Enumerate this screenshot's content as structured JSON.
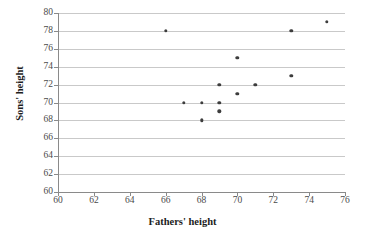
{
  "chart_data": {
    "type": "scatter",
    "title": "",
    "xlabel": "Fathers' height",
    "ylabel": "Sons' height",
    "xlim": [
      60,
      76
    ],
    "ylim": [
      60,
      80
    ],
    "xticks": [
      60,
      62,
      64,
      66,
      68,
      70,
      72,
      74,
      76
    ],
    "yticks": [
      60,
      62,
      64,
      66,
      68,
      70,
      72,
      74,
      76,
      78,
      80
    ],
    "grid": "horizontal",
    "legend": "none",
    "marker_color": "#3d3d3d",
    "gridline_color": "#c9c9c9",
    "axis_color": "#8a8a8a",
    "points": [
      {
        "x": 66,
        "y": 78
      },
      {
        "x": 67,
        "y": 70
      },
      {
        "x": 68,
        "y": 70
      },
      {
        "x": 68,
        "y": 68
      },
      {
        "x": 69,
        "y": 72
      },
      {
        "x": 69,
        "y": 70
      },
      {
        "x": 69,
        "y": 69
      },
      {
        "x": 70,
        "y": 75
      },
      {
        "x": 70,
        "y": 71
      },
      {
        "x": 71,
        "y": 72
      },
      {
        "x": 73,
        "y": 78
      },
      {
        "x": 73,
        "y": 73
      },
      {
        "x": 75,
        "y": 79
      }
    ]
  }
}
